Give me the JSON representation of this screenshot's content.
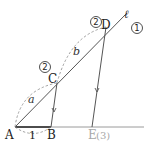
{
  "diagram": {
    "type": "geometry-parallel-lines-ratio",
    "points": {
      "A": {
        "label": "A",
        "x": 15,
        "y": 127
      },
      "B": {
        "label": "B",
        "x": 51,
        "y": 127
      },
      "C": {
        "label": "C",
        "x": 57,
        "y": 83
      },
      "D": {
        "label": "D",
        "x": 106,
        "y": 27
      },
      "E": {
        "label": "E",
        "x": 92,
        "y": 127
      }
    },
    "line_label": "ℓ",
    "segment_labels": {
      "AB": "1",
      "AC": "a",
      "CD": "b"
    },
    "circled_labels": {
      "near_C": "2",
      "near_D": "2",
      "near_line": "1"
    },
    "E_suffix": "(3)",
    "colors": {
      "line": "#555555",
      "bold_segment": "#222222",
      "dashed": "#8a8a8a",
      "gray_label": "#a8a8a8"
    }
  }
}
